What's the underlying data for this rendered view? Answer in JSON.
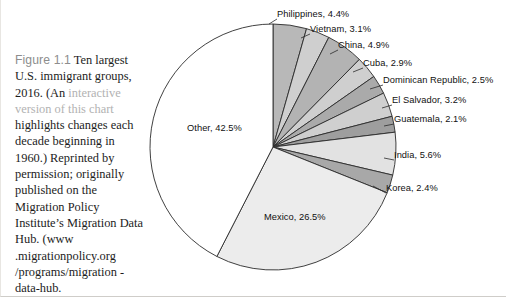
{
  "caption": {
    "figure_number": "Figure 1.1",
    "line_1": "Ten largest",
    "line_2": "U.S. immigrant groups,",
    "line_3_prefix": "2016. (An ",
    "link_text_1": "interactive",
    "link_text_2": "version of this chart",
    "line_4": "highlights changes each",
    "line_5": "decade beginning in",
    "line_6": "1960.) Reprinted by",
    "line_7": "permission; originally",
    "line_8": "published on the",
    "line_9": "Migration Policy",
    "line_10": "Institute’s Migration",
    "line_11": "Data Hub. (www",
    "line_12": ".migrationpolicy.org",
    "line_13": "/programs/migration",
    "line_14": "-data-hub."
  },
  "chart_data": {
    "type": "pie",
    "title": "Ten largest U.S. immigrant groups, 2016",
    "start_angle_deg": 0,
    "direction": "clockwise",
    "center": {
      "x": 272,
      "y": 147
    },
    "radius": 123,
    "grid": false,
    "legend": "none",
    "labels_position": "outside-with-leader-lines",
    "categories": [
      "Philippines",
      "Vietnam",
      "China",
      "Cuba",
      "Dominican Republic",
      "El Salvador",
      "Guatemala",
      "India",
      "Korea",
      "Mexico",
      "Other"
    ],
    "values": [
      4.4,
      3.1,
      4.9,
      2.9,
      2.5,
      3.2,
      2.1,
      5.6,
      2.4,
      26.5,
      42.5
    ],
    "units": "percent",
    "slices": [
      {
        "name": "Philippines",
        "value": 4.4,
        "label": "Philippines, 4.4%",
        "color": "#b8b8b8",
        "label_x": 276,
        "label_y": 9,
        "leader_from_x": 268,
        "leader_from_y": 24,
        "leader_to_x": 276,
        "leader_to_y": 19
      },
      {
        "name": "Vietnam",
        "value": 3.1,
        "label": "Vietnam, 3.1%",
        "color": "#cfcfcf",
        "label_x": 309,
        "label_y": 24,
        "leader_from_x": 300,
        "leader_from_y": 38,
        "leader_to_x": 309,
        "leader_to_y": 34
      },
      {
        "name": "China",
        "value": 4.9,
        "label": "China, 4.9%",
        "color": "#b3b3b3",
        "label_x": 337,
        "label_y": 40,
        "leader_from_x": 329,
        "leader_from_y": 54,
        "leader_to_x": 337,
        "leader_to_y": 50
      },
      {
        "name": "Cuba",
        "value": 2.9,
        "label": "Cuba, 2.9%",
        "color": "#cfcfcf",
        "label_x": 362,
        "label_y": 58,
        "leader_from_x": 352,
        "leader_from_y": 72,
        "leader_to_x": 362,
        "leader_to_y": 68
      },
      {
        "name": "Dominican Republic",
        "value": 2.5,
        "label": "Dominican Republic, 2.5%",
        "color": "#aaaaaa",
        "label_x": 382,
        "label_y": 75,
        "leader_from_x": 369,
        "leader_from_y": 89,
        "leader_to_x": 382,
        "leader_to_y": 85
      },
      {
        "name": "El Salvador",
        "value": 3.2,
        "label": "El Salvador, 3.2%",
        "color": "#cfcfcf",
        "label_x": 391,
        "label_y": 95,
        "leader_from_x": 381,
        "leader_from_y": 108,
        "leader_to_x": 391,
        "leader_to_y": 105
      },
      {
        "name": "Guatemala",
        "value": 2.1,
        "label": "Guatemala, 2.1%",
        "color": "#9e9e9e",
        "label_x": 393,
        "label_y": 114,
        "leader_from_x": 383,
        "leader_from_y": 126,
        "leader_to_x": 393,
        "leader_to_y": 124
      },
      {
        "name": "India",
        "value": 5.6,
        "label": "India, 5.6%",
        "color": "#e2e2e2",
        "label_x": 393,
        "label_y": 150,
        "leader_from_x": 383,
        "leader_from_y": 158,
        "leader_to_x": 393,
        "leader_to_y": 160
      },
      {
        "name": "Korea",
        "value": 2.4,
        "label": "Korea, 2.4%",
        "color": "#a8a8a8",
        "label_x": 385,
        "label_y": 183,
        "leader_from_x": 372,
        "leader_from_y": 186,
        "leader_to_x": 385,
        "leader_to_y": 193
      },
      {
        "name": "Mexico",
        "value": 26.5,
        "label": "Mexico, 26.5%",
        "color": "#ececec",
        "label_x": 263,
        "label_y": 212,
        "inside": true
      },
      {
        "name": "Other",
        "value": 42.5,
        "label": "Other, 42.5%",
        "color": "#ffffff",
        "label_x": 186,
        "label_y": 123,
        "inside": true
      }
    ]
  }
}
